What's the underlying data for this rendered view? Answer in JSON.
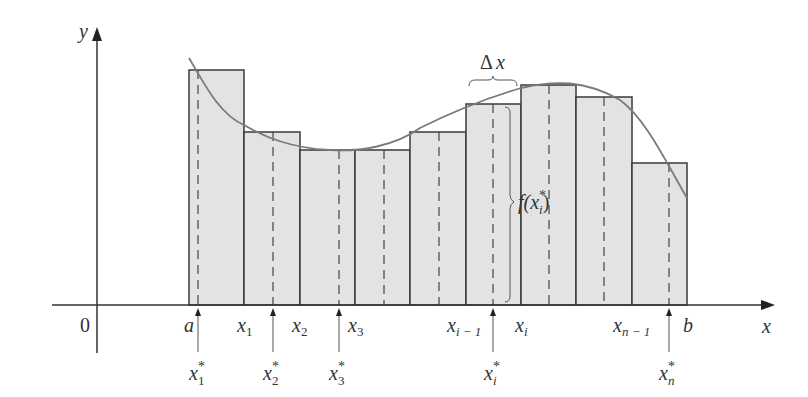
{
  "figure": {
    "colors": {
      "background": "#ffffff",
      "rect_fill": "#e3e3e3",
      "rect_stroke": "#3a3a3a",
      "curve": "#7a7a7a",
      "axis": "#333333",
      "text": "#333333"
    }
  },
  "axes": {
    "y_label": "y",
    "x_label": "x",
    "origin_label": "0",
    "origin_px": {
      "x": 97,
      "y": 305
    }
  },
  "partition_labels": {
    "a": "a",
    "x1": "x",
    "x1_sub": "1",
    "x2": "x",
    "x2_sub": "2",
    "x3": "x",
    "x3_sub": "3",
    "xim1": "x",
    "xim1_sub": "i − 1",
    "xi": "x",
    "xi_sub": "i",
    "xnm1": "x",
    "xnm1_sub": "n − 1",
    "b": "b"
  },
  "sample_labels": {
    "s1": "x",
    "s1_sup": "*",
    "s1_sub": "1",
    "s2": "x",
    "s2_sup": "*",
    "s2_sub": "2",
    "s3": "x",
    "s3_sup": "*",
    "s3_sub": "3",
    "si": "x",
    "si_sup": "*",
    "si_sub": "i",
    "sn": "x",
    "sn_sup": "*",
    "sn_sub": "n"
  },
  "annotations": {
    "delta_x": "Δ x",
    "f_of": "f(x",
    "f_sup": "*",
    "f_sub": "i",
    "f_close": ")"
  },
  "rectangles": [
    {
      "left": 189,
      "right": 244,
      "top": 70,
      "sample": 198
    },
    {
      "left": 244,
      "right": 300,
      "top": 132,
      "sample": 273
    },
    {
      "left": 300,
      "right": 355,
      "top": 150,
      "sample": 339
    },
    {
      "left": 355,
      "right": 410,
      "top": 150,
      "sample": 384
    },
    {
      "left": 410,
      "right": 466,
      "top": 132,
      "sample": 439
    },
    {
      "left": 466,
      "right": 521,
      "top": 104,
      "sample": 493
    },
    {
      "left": 521,
      "right": 576,
      "top": 85,
      "sample": 549
    },
    {
      "left": 576,
      "right": 632,
      "top": 97,
      "sample": 604
    },
    {
      "left": 632,
      "right": 687,
      "top": 163,
      "sample": 669
    }
  ]
}
